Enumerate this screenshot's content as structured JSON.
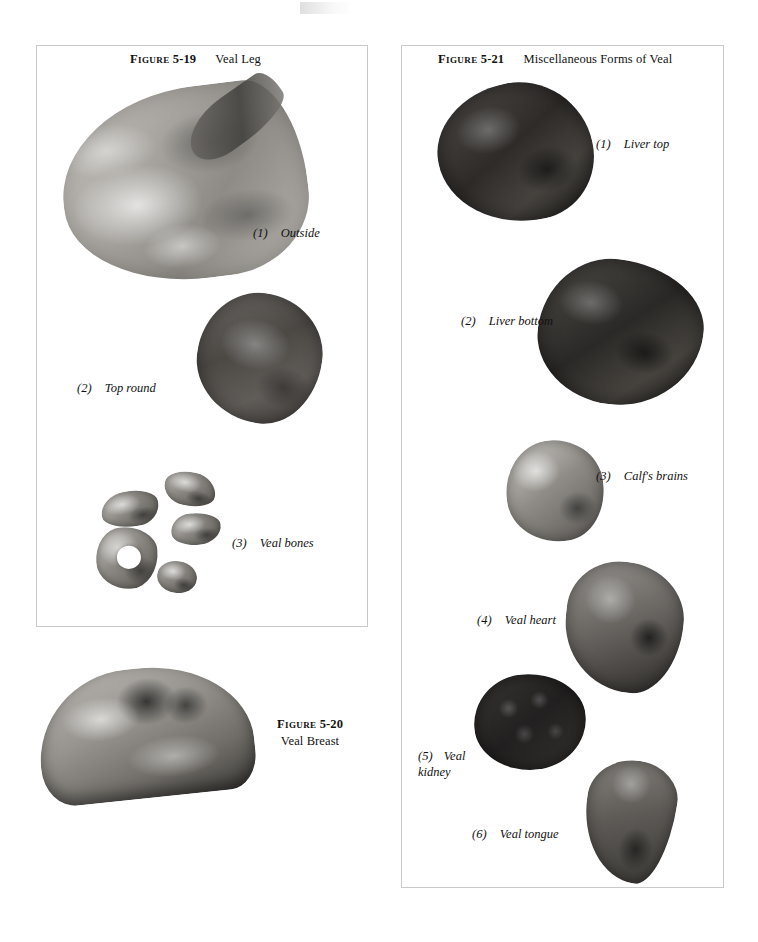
{
  "page": {
    "background_color": "#ffffff",
    "text_color": "#111111",
    "panel_border_color": "#c9c9c9"
  },
  "figures": [
    {
      "id": "5-19",
      "caption": {
        "label": "Figure",
        "number": "5-19",
        "title": "Veal Leg"
      },
      "items": [
        {
          "number": "(1)",
          "label": "Outside"
        },
        {
          "number": "(2)",
          "label": "Top round"
        },
        {
          "number": "(3)",
          "label": "Veal bones"
        }
      ],
      "photos": [
        {
          "name": "veal-leg-outside"
        },
        {
          "name": "veal-top-round"
        },
        {
          "name": "veal-bones"
        }
      ]
    },
    {
      "id": "5-20",
      "caption": {
        "label": "Figure",
        "number": "5-20",
        "title": "Veal Breast"
      },
      "items": [],
      "photos": [
        {
          "name": "veal-breast"
        }
      ]
    },
    {
      "id": "5-21",
      "caption": {
        "label": "Figure",
        "number": "5-21",
        "title": "Miscellaneous Forms of Veal"
      },
      "items": [
        {
          "number": "(1)",
          "label": "Liver top"
        },
        {
          "number": "(2)",
          "label": "Liver bottom"
        },
        {
          "number": "(3)",
          "label": "Calf's brains"
        },
        {
          "number": "(4)",
          "label": "Veal heart"
        },
        {
          "number": "(5)",
          "label": "Veal",
          "label_line2": "kidney"
        },
        {
          "number": "(6)",
          "label": "Veal tongue"
        }
      ],
      "photos": [
        {
          "name": "liver-top"
        },
        {
          "name": "liver-bottom"
        },
        {
          "name": "calfs-brains"
        },
        {
          "name": "veal-heart"
        },
        {
          "name": "veal-kidney"
        },
        {
          "name": "veal-tongue"
        }
      ]
    }
  ]
}
